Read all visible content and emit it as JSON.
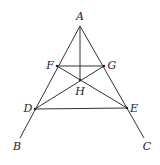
{
  "diagram": {
    "type": "geometry",
    "colors": {
      "line": "#333333",
      "label": "#222222",
      "background": "#ffffff"
    },
    "points": {
      "A": {
        "label": "A",
        "x": 80,
        "y": 26,
        "lx": 80,
        "ly": 20
      },
      "F": {
        "label": "F",
        "x": 57,
        "y": 66,
        "lx": 50,
        "ly": 69
      },
      "G": {
        "label": "G",
        "x": 104,
        "y": 66,
        "lx": 112,
        "ly": 69
      },
      "H": {
        "label": "H",
        "x": 80,
        "y": 80,
        "lx": 80,
        "ly": 95
      },
      "D": {
        "label": "D",
        "x": 35,
        "y": 109,
        "lx": 28,
        "ly": 112
      },
      "E": {
        "label": "E",
        "x": 127,
        "y": 108,
        "lx": 134,
        "ly": 112
      },
      "B": {
        "label": "B",
        "x": 20,
        "y": 138,
        "lx": 17,
        "ly": 150
      },
      "C": {
        "label": "C",
        "x": 144,
        "y": 138,
        "lx": 147,
        "ly": 150
      }
    },
    "segments": [
      [
        "A",
        "B"
      ],
      [
        "A",
        "C"
      ],
      [
        "A",
        "H"
      ],
      [
        "F",
        "G"
      ],
      [
        "D",
        "E"
      ],
      [
        "F",
        "E"
      ],
      [
        "G",
        "D"
      ]
    ]
  }
}
